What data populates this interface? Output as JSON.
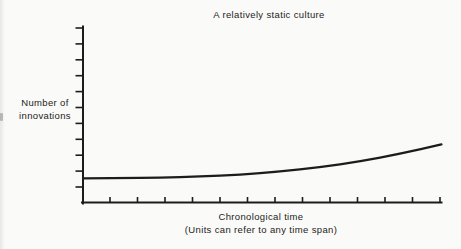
{
  "figure": {
    "background": "#fafaf8",
    "ink_color": "#1d1c1a"
  },
  "chart_data": {
    "type": "line",
    "title": "A relatively static culture",
    "xlabel": "Chronological time",
    "xlabel_note": "(Units can refer to any time span)",
    "ylabel_line1": "Number of",
    "ylabel_line2": "innovations",
    "x_axis": {
      "tick_count": 13,
      "numeric_labels": false,
      "range_note": "unlabeled time units"
    },
    "y_axis": {
      "tick_count": 11,
      "numeric_labels": false,
      "range_note": "unlabeled innovation counts"
    },
    "grid": false,
    "legend": false,
    "series": [
      {
        "name": "innovations-over-time",
        "description": "Nearly flat curve that slowly accelerates upward toward the right (slow exponential growth of innovations in a static culture)",
        "points_norm": [
          [
            0.0,
            0.138
          ],
          [
            0.103,
            0.139
          ],
          [
            0.215,
            0.142
          ],
          [
            0.327,
            0.148
          ],
          [
            0.439,
            0.158
          ],
          [
            0.55,
            0.177
          ],
          [
            0.662,
            0.201
          ],
          [
            0.774,
            0.234
          ],
          [
            0.886,
            0.278
          ],
          [
            1.001,
            0.331
          ]
        ]
      }
    ]
  }
}
